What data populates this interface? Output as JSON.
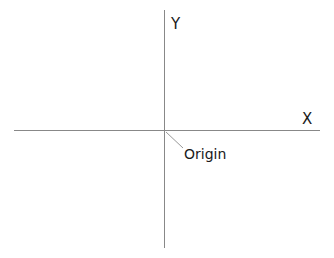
{
  "diagram": {
    "type": "coordinate-axes",
    "x_axis": {
      "label": "X",
      "from": [
        14,
        130
      ],
      "to": [
        320,
        130
      ],
      "color": "#888888"
    },
    "y_axis": {
      "label": "Y",
      "from": [
        164,
        10
      ],
      "to": [
        164,
        248
      ],
      "color": "#888888"
    },
    "origin": {
      "label": "Origin",
      "point": [
        164,
        130
      ],
      "leader_from": [
        166,
        132
      ],
      "leader_to": [
        183,
        148
      ],
      "leader_color": "#999999"
    },
    "text_color": "#1a1a1a",
    "background": "#ffffff"
  }
}
